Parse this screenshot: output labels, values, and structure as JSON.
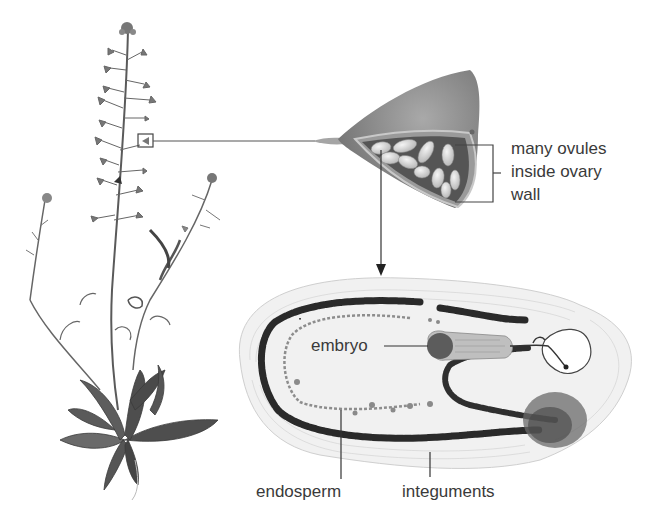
{
  "diagram": {
    "panels": [
      {
        "id": "whole-plant",
        "description": "Whole plant with flowering stems and basal rosette"
      },
      {
        "id": "fruit",
        "description": "Heart-shaped fruit (silicle) cut open showing ovules"
      },
      {
        "id": "ovule-section",
        "description": "Micrograph of ovule longitudinal section"
      }
    ],
    "labels": {
      "ovules_line1": "many ovules",
      "ovules_line2": "inside ovary",
      "ovules_line3": "wall",
      "embryo": "embryo",
      "endosperm": "endosperm",
      "integuments": "integuments"
    },
    "colors": {
      "text": "#3a3a3a",
      "line": "#3a3a3a",
      "fruit": "#8a8a8a",
      "ovule": "#dcdcdc",
      "plant": "#555555",
      "section_dark": "#2a2a2a"
    }
  }
}
